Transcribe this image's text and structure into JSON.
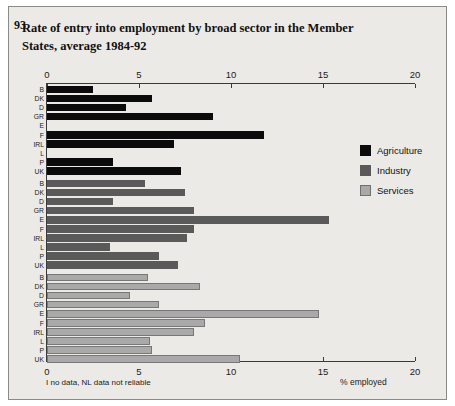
{
  "figure": {
    "number": "93",
    "title": "Rate of entry into employment by broad sector in the Member States, average 1984-92",
    "footnote": "I no data, NL data not reliable",
    "xlabel": "% employed"
  },
  "legend": {
    "position": "right",
    "items": [
      {
        "label": "Agriculture",
        "color": "#0b0b0b"
      },
      {
        "label": "Industry",
        "color": "#5a5a5a"
      },
      {
        "label": "Services",
        "color": "#a9a9a9"
      }
    ]
  },
  "chart_data": {
    "type": "bar",
    "orientation": "horizontal",
    "title": "Rate of entry into employment by broad sector in the Member States, average 1984-92",
    "xlabel": "% employed",
    "ylabel": "",
    "xlim": [
      0,
      20
    ],
    "xticks": [
      0,
      5,
      10,
      15,
      20
    ],
    "xtick_labels": [
      "0",
      "5",
      "10",
      "15",
      "20"
    ],
    "grid": false,
    "categories": [
      "B",
      "DK",
      "D",
      "GR",
      "E",
      "F",
      "IRL",
      "L",
      "P",
      "UK"
    ],
    "panels": [
      {
        "name": "Agriculture",
        "color": "#0b0b0b",
        "values": [
          2.5,
          5.7,
          4.3,
          9.0,
          0.0,
          11.8,
          6.9,
          0.0,
          3.6,
          7.3
        ]
      },
      {
        "name": "Industry",
        "color": "#5a5a5a",
        "values": [
          5.3,
          7.5,
          3.6,
          8.0,
          15.3,
          8.0,
          7.6,
          3.4,
          6.1,
          7.1
        ]
      },
      {
        "name": "Services",
        "color": "#a9a9a9",
        "values": [
          5.5,
          8.3,
          4.5,
          6.1,
          14.8,
          8.6,
          8.0,
          5.6,
          5.7,
          10.5
        ]
      }
    ],
    "series": [
      {
        "name": "Agriculture",
        "values": [
          2.5,
          5.7,
          4.3,
          9.0,
          0.0,
          11.8,
          6.9,
          0.0,
          3.6,
          7.3
        ]
      },
      {
        "name": "Industry",
        "values": [
          5.3,
          7.5,
          3.6,
          8.0,
          15.3,
          8.0,
          7.6,
          3.4,
          6.1,
          7.1
        ]
      },
      {
        "name": "Services",
        "values": [
          5.5,
          8.3,
          4.5,
          6.1,
          14.8,
          8.6,
          8.0,
          5.6,
          5.7,
          10.5
        ]
      }
    ]
  }
}
